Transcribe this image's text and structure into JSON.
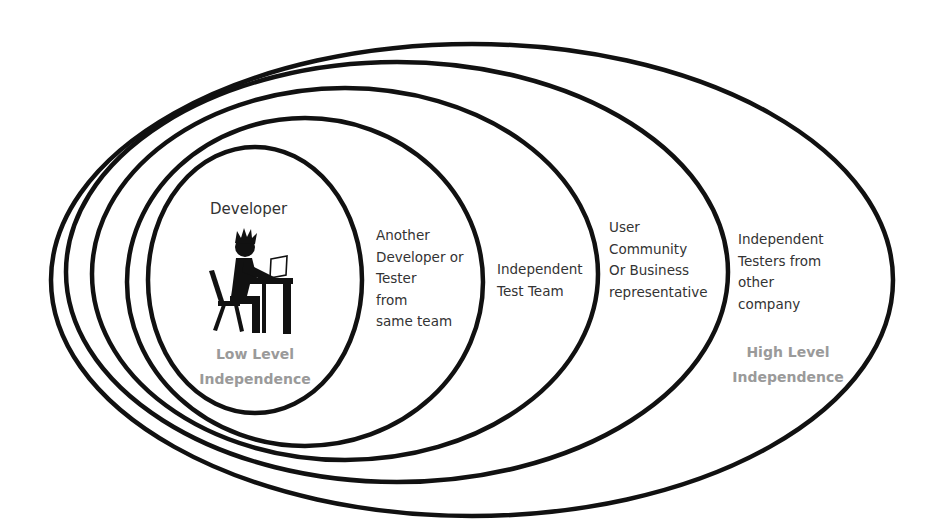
{
  "diagram": {
    "type": "nested-ellipses",
    "stroke_color": "#111111",
    "background": "#ffffff",
    "ellipses": [
      {
        "level": 1,
        "cx": 255,
        "cy": 280,
        "rx": 107,
        "ry": 133
      },
      {
        "level": 2,
        "cx": 305,
        "cy": 282,
        "rx": 178,
        "ry": 164
      },
      {
        "level": 3,
        "cx": 345,
        "cy": 274,
        "rx": 253,
        "ry": 186
      },
      {
        "level": 4,
        "cx": 397,
        "cy": 272,
        "rx": 331,
        "ry": 210
      },
      {
        "level": 5,
        "cx": 472,
        "cy": 280,
        "rx": 421,
        "ry": 236
      }
    ],
    "developer": {
      "title": "Developer",
      "icon": "developer-at-desk-icon"
    },
    "low_level": [
      "Low Level",
      "Independence"
    ],
    "high_level": [
      "High Level",
      "Independence"
    ],
    "accent_gray": "#9a9a9a",
    "rings": [
      {
        "name": "another-developer",
        "lines": [
          "Another",
          "Developer or",
          "Tester",
          "from",
          "same team"
        ]
      },
      {
        "name": "independent-test-team",
        "lines": [
          "Independent",
          "Test Team"
        ]
      },
      {
        "name": "user-community",
        "lines": [
          "User",
          "Community",
          "Or Business",
          "representative"
        ]
      },
      {
        "name": "independent-testers",
        "lines": [
          "Independent",
          "Testers from",
          "other",
          "company"
        ]
      }
    ]
  }
}
